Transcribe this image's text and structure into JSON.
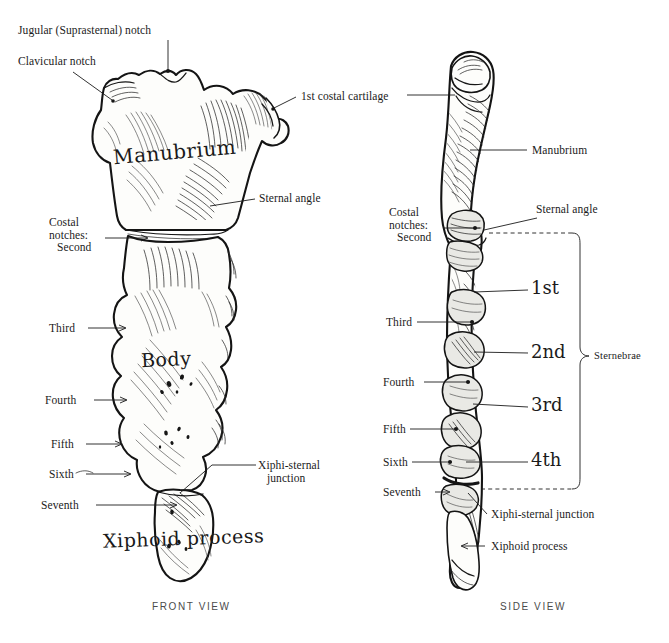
{
  "figure": {
    "ink_color": "#1a1a1a",
    "background_color": "#ffffff",
    "bone_fill": "#fdfdfb"
  },
  "views": [
    {
      "id": "front",
      "caption": "FRONT VIEW"
    },
    {
      "id": "side",
      "caption": "SIDE VIEW"
    }
  ],
  "front_view": {
    "caption": "FRONT VIEW",
    "part_labels": [
      {
        "name": "manubrium",
        "text": "Manubrium"
      },
      {
        "name": "body",
        "text": "Body"
      },
      {
        "name": "xiphoid-process",
        "text": "Xiphoid process"
      }
    ],
    "callouts": [
      {
        "name": "jugular-notch",
        "text": "Jugular (Suprasternal) notch"
      },
      {
        "name": "clavicular-notch",
        "text": "Clavicular notch"
      },
      {
        "name": "first-costal-cartilage",
        "text": "1st costal cartilage"
      },
      {
        "name": "sternal-angle",
        "text": "Sternal angle"
      },
      {
        "name": "costal-notches-head",
        "text": "Costal\nnotches:"
      },
      {
        "name": "costal-notch-second",
        "text": "Second"
      },
      {
        "name": "costal-notch-third",
        "text": "Third"
      },
      {
        "name": "costal-notch-fourth",
        "text": "Fourth"
      },
      {
        "name": "costal-notch-fifth",
        "text": "Fifth"
      },
      {
        "name": "costal-notch-sixth",
        "text": "Sixth"
      },
      {
        "name": "costal-notch-seventh",
        "text": "Seventh"
      },
      {
        "name": "xiphi-sternal-junction",
        "text": "Xiphi-sternal\n   junction"
      }
    ]
  },
  "side_view": {
    "caption": "SIDE VIEW",
    "callouts": [
      {
        "name": "manubrium",
        "text": "Manubrium"
      },
      {
        "name": "sternal-angle",
        "text": "Sternal angle"
      },
      {
        "name": "costal-notches-head",
        "text": "Costal\nnotches:"
      },
      {
        "name": "costal-notch-second",
        "text": "Second"
      },
      {
        "name": "costal-notch-third",
        "text": "Third"
      },
      {
        "name": "costal-notch-fourth",
        "text": "Fourth"
      },
      {
        "name": "costal-notch-fifth",
        "text": "Fifth"
      },
      {
        "name": "costal-notch-sixth",
        "text": "Sixth"
      },
      {
        "name": "costal-notch-seventh",
        "text": "Seventh"
      },
      {
        "name": "xiphi-sternal-junction",
        "text": "Xiphi-sternal junction"
      },
      {
        "name": "xiphoid-process",
        "text": "Xiphoid process"
      }
    ],
    "sternebrae": {
      "bracket_label": "Sternebrae",
      "segments": [
        {
          "name": "sternebra-1",
          "text": "1st"
        },
        {
          "name": "sternebra-2",
          "text": "2nd"
        },
        {
          "name": "sternebra-3",
          "text": "3rd"
        },
        {
          "name": "sternebra-4",
          "text": "4th"
        }
      ]
    }
  }
}
